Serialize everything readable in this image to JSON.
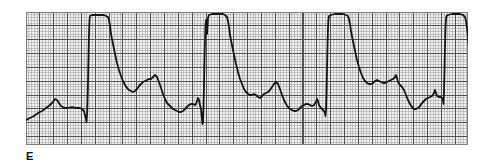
{
  "figure": {
    "panel_label": "E",
    "kind": "ecg-rhythm-strip"
  },
  "paper": {
    "background_color": "#f2f0ee",
    "fine_grid_color": "#9a9a9a",
    "bold_grid_color": "#4a4a4a",
    "border_color": "#808080",
    "fine_grid_mm": 1,
    "bold_grid_every": 5,
    "fine_grid_px": 2.77,
    "bold_grid_px": 13.85,
    "left_px": 26,
    "top_px": 12,
    "width_px": 442,
    "height_px": 133
  },
  "trace": {
    "color": "#151515",
    "stroke_width": 1.8,
    "units": {
      "x": "paper-pixels from paper left edge",
      "y": "paper-pixels from paper top edge"
    },
    "beat_count": 4,
    "qrs_onsets_px": [
      61,
      176,
      300,
      418
    ],
    "qrs_top_y_px": 4,
    "baseline_y_px": 96,
    "chart_data": {
      "type": "line",
      "title": "",
      "xlabel": "",
      "ylabel": "",
      "grid": true,
      "legend": null,
      "xlim": [
        0,
        442
      ],
      "ylim": [
        133,
        0
      ],
      "series": [
        {
          "name": "ECG lead",
          "points": [
            [
              0,
              108
            ],
            [
              4,
              106
            ],
            [
              8,
              104
            ],
            [
              12,
              101
            ],
            [
              16,
              99
            ],
            [
              20,
              96
            ],
            [
              24,
              93
            ],
            [
              27,
              90
            ],
            [
              29,
              87
            ],
            [
              31,
              88
            ],
            [
              33,
              91
            ],
            [
              35,
              94
            ],
            [
              38,
              96
            ],
            [
              42,
              96
            ],
            [
              46,
              95
            ],
            [
              50,
              96
            ],
            [
              54,
              96
            ],
            [
              56,
              97
            ],
            [
              58,
              99
            ],
            [
              59,
              103
            ],
            [
              60,
              107
            ],
            [
              60.5,
              110
            ],
            [
              61,
              104
            ],
            [
              61.5,
              90
            ],
            [
              62,
              70
            ],
            [
              62.5,
              45
            ],
            [
              63,
              22
            ],
            [
              63.5,
              8
            ],
            [
              64,
              4
            ],
            [
              66,
              3
            ],
            [
              70,
              3
            ],
            [
              74,
              3
            ],
            [
              78,
              3
            ],
            [
              80,
              4
            ],
            [
              82,
              5
            ],
            [
              83,
              8
            ],
            [
              84,
              14
            ],
            [
              85,
              22
            ],
            [
              87,
              32
            ],
            [
              89,
              42
            ],
            [
              91,
              51
            ],
            [
              93,
              58
            ],
            [
              95,
              64
            ],
            [
              97,
              69
            ],
            [
              99,
              73
            ],
            [
              101,
              76
            ],
            [
              103,
              78
            ],
            [
              105,
              79
            ],
            [
              107,
              80
            ],
            [
              109,
              79
            ],
            [
              111,
              77
            ],
            [
              113,
              74
            ],
            [
              115,
              72
            ],
            [
              117,
              70
            ],
            [
              119,
              69
            ],
            [
              121,
              68
            ],
            [
              123,
              67
            ],
            [
              125,
              67
            ],
            [
              127,
              65
            ],
            [
              129,
              63
            ],
            [
              131,
              65
            ],
            [
              133,
              70
            ],
            [
              135,
              76
            ],
            [
              137,
              82
            ],
            [
              139,
              87
            ],
            [
              141,
              91
            ],
            [
              143,
              93
            ],
            [
              145,
              95
            ],
            [
              147,
              97
            ],
            [
              149,
              98
            ],
            [
              151,
              99
            ],
            [
              153,
              100
            ],
            [
              155,
              100
            ],
            [
              157,
              99
            ],
            [
              159,
              97
            ],
            [
              161,
              95
            ],
            [
              163,
              93
            ],
            [
              165,
              92
            ],
            [
              167,
              92
            ],
            [
              169,
              93
            ],
            [
              170,
              92
            ],
            [
              171,
              89
            ],
            [
              172,
              86
            ],
            [
              173,
              88
            ],
            [
              174,
              93
            ],
            [
              175,
              97
            ],
            [
              175.5,
              102
            ],
            [
              176,
              107
            ],
            [
              176.5,
              112
            ],
            [
              177,
              110
            ],
            [
              177.5,
              95
            ],
            [
              178,
              72
            ],
            [
              178.5,
              48
            ],
            [
              179,
              28
            ],
            [
              179.5,
              14
            ],
            [
              180,
              8
            ],
            [
              180.5,
              16
            ],
            [
              181,
              22
            ],
            [
              181.5,
              14
            ],
            [
              182,
              6
            ],
            [
              183,
              3
            ],
            [
              186,
              2
            ],
            [
              190,
              2
            ],
            [
              194,
              2
            ],
            [
              197,
              2
            ],
            [
              199,
              3
            ],
            [
              201,
              5
            ],
            [
              202,
              9
            ],
            [
              203,
              15
            ],
            [
              204,
              23
            ],
            [
              206,
              33
            ],
            [
              208,
              43
            ],
            [
              210,
              52
            ],
            [
              212,
              60
            ],
            [
              214,
              67
            ],
            [
              216,
              72
            ],
            [
              218,
              77
            ],
            [
              220,
              80
            ],
            [
              222,
              82
            ],
            [
              224,
              83
            ],
            [
              226,
              83
            ],
            [
              228,
              82
            ],
            [
              230,
              83
            ],
            [
              232,
              85
            ],
            [
              234,
              86
            ],
            [
              236,
              84
            ],
            [
              238,
              82
            ],
            [
              240,
              81
            ],
            [
              242,
              80
            ],
            [
              244,
              78
            ],
            [
              246,
              75
            ],
            [
              248,
              72
            ],
            [
              250,
              70
            ],
            [
              252,
              72
            ],
            [
              254,
              77
            ],
            [
              256,
              83
            ],
            [
              258,
              88
            ],
            [
              260,
              92
            ],
            [
              262,
              95
            ],
            [
              264,
              97
            ],
            [
              266,
              98
            ],
            [
              268,
              99
            ],
            [
              270,
              99
            ],
            [
              272,
              98
            ],
            [
              274,
              96
            ],
            [
              276,
              94
            ],
            [
              278,
              93
            ],
            [
              280,
              92
            ],
            [
              282,
              92
            ],
            [
              284,
              93
            ],
            [
              286,
              94
            ],
            [
              288,
              93
            ],
            [
              290,
              90
            ],
            [
              291,
              87
            ],
            [
              292,
              89
            ],
            [
              293,
              93
            ],
            [
              295,
              96
            ],
            [
              297,
              98
            ],
            [
              298,
              99
            ],
            [
              299,
              101
            ],
            [
              299.5,
              104
            ],
            [
              300,
              98
            ],
            [
              300.5,
              82
            ],
            [
              301,
              58
            ],
            [
              301.5,
              34
            ],
            [
              302,
              16
            ],
            [
              302.5,
              7
            ],
            [
              303,
              4
            ],
            [
              305,
              3
            ],
            [
              309,
              2
            ],
            [
              313,
              2
            ],
            [
              317,
              2
            ],
            [
              320,
              3
            ],
            [
              322,
              4
            ],
            [
              323,
              7
            ],
            [
              324,
              12
            ],
            [
              325,
              19
            ],
            [
              327,
              29
            ],
            [
              329,
              39
            ],
            [
              331,
              48
            ],
            [
              333,
              55
            ],
            [
              335,
              61
            ],
            [
              337,
              66
            ],
            [
              339,
              69
            ],
            [
              341,
              71
            ],
            [
              343,
              72
            ],
            [
              345,
              72
            ],
            [
              347,
              71
            ],
            [
              349,
              69
            ],
            [
              351,
              68
            ],
            [
              353,
              69
            ],
            [
              355,
              70
            ],
            [
              357,
              71
            ],
            [
              359,
              71
            ],
            [
              361,
              70
            ],
            [
              363,
              69
            ],
            [
              365,
              68
            ],
            [
              367,
              67
            ],
            [
              369,
              65
            ],
            [
              370,
              63
            ],
            [
              371,
              66
            ],
            [
              372,
              70
            ],
            [
              374,
              73
            ],
            [
              376,
              75
            ],
            [
              378,
              78
            ],
            [
              380,
              83
            ],
            [
              382,
              88
            ],
            [
              384,
              92
            ],
            [
              386,
              95
            ],
            [
              388,
              97
            ],
            [
              390,
              97
            ],
            [
              392,
              96
            ],
            [
              394,
              94
            ],
            [
              396,
              91
            ],
            [
              398,
              89
            ],
            [
              400,
              87
            ],
            [
              402,
              86
            ],
            [
              404,
              85
            ],
            [
              406,
              84
            ],
            [
              408,
              81
            ],
            [
              409,
              78
            ],
            [
              410,
              81
            ],
            [
              411,
              84
            ],
            [
              413,
              85
            ],
            [
              415,
              85
            ],
            [
              416,
              86
            ],
            [
              417,
              88
            ],
            [
              417.5,
              92
            ],
            [
              418,
              80
            ],
            [
              418.5,
              58
            ],
            [
              419,
              34
            ],
            [
              419.5,
              16
            ],
            [
              420,
              7
            ],
            [
              420.5,
              4
            ],
            [
              422,
              3
            ],
            [
              426,
              2
            ],
            [
              430,
              2
            ],
            [
              434,
              2
            ],
            [
              437,
              3
            ],
            [
              439,
              5
            ],
            [
              440,
              9
            ],
            [
              441,
              16
            ],
            [
              442,
              26
            ],
            [
              443,
              36
            ],
            [
              444,
              45
            ],
            [
              445,
              52
            ],
            [
              446,
              57
            ],
            [
              447,
              60
            ],
            [
              448,
              62
            ],
            [
              449,
              61
            ],
            [
              450,
              60
            ]
          ]
        }
      ]
    }
  }
}
